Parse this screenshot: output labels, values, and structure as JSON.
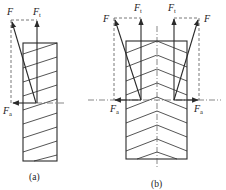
{
  "figure": {
    "panel_a": {
      "caption": "(a)",
      "description": "single helical gear force decomposition",
      "labels": {
        "F": {
          "main": "F",
          "sub": ""
        },
        "Ft": {
          "main": "F",
          "sub": "t"
        },
        "Fa": {
          "main": "F",
          "sub": "a"
        }
      }
    },
    "panel_b": {
      "caption": "(b)",
      "description": "herringbone gear force decomposition",
      "labels": {
        "F_left": {
          "main": "F",
          "sub": ""
        },
        "Ft_left": {
          "main": "F",
          "sub": "t"
        },
        "Ft_right": {
          "main": "F",
          "sub": "t"
        },
        "F_right": {
          "main": "F",
          "sub": ""
        },
        "Fa_left": {
          "main": "F",
          "sub": "a"
        },
        "Fa_right": {
          "main": "F",
          "sub": "a"
        }
      }
    },
    "colors": {
      "line": "#2a2a2a",
      "construction": "#555555",
      "background": "#ffffff"
    }
  }
}
